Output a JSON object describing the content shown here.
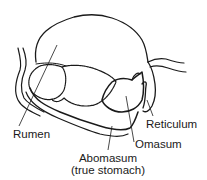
{
  "diagram": {
    "labels": {
      "rumen": "Rumen",
      "reticulum": "Reticulum",
      "omasum": "Omasum",
      "abomasum": "Abomasum",
      "abomasum_note": "(true stomach)"
    },
    "colors": {
      "ink": "#1a1a1a",
      "background": "#ffffff"
    }
  }
}
